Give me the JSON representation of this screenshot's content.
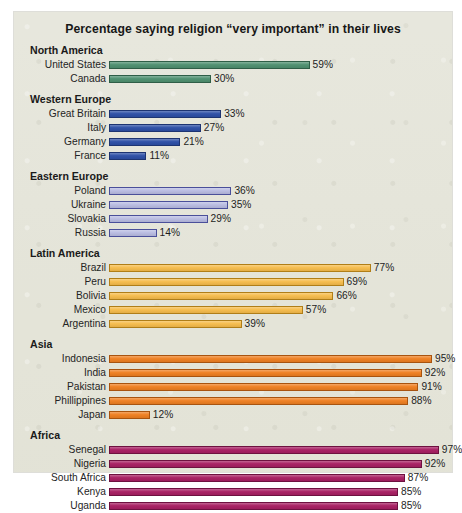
{
  "chart_data": {
    "type": "bar",
    "orientation": "horizontal",
    "title": "Percentage saying religion “very important” in their lives",
    "xlabel": "",
    "ylabel": "",
    "xlim": [
      0,
      100
    ],
    "unit": "%",
    "grid": false,
    "legend": "none",
    "value_label_format": "{value}%",
    "groups": [
      {
        "name": "North America",
        "color": "#4f9070",
        "categories": [
          "United States",
          "Canada"
        ],
        "values": [
          59,
          30
        ],
        "labels": [
          "59%",
          "30%"
        ]
      },
      {
        "name": "Western Europe",
        "color": "#2d4fa6",
        "categories": [
          "Great Britain",
          "Italy",
          "Germany",
          "France"
        ],
        "values": [
          33,
          27,
          21,
          11
        ],
        "labels": [
          "33%",
          "27%",
          "21%",
          "11%"
        ]
      },
      {
        "name": "Eastern Europe",
        "color": "#b9bce2",
        "categories": [
          "Poland",
          "Ukraine",
          "Slovakia",
          "Russia"
        ],
        "values": [
          36,
          35,
          29,
          14
        ],
        "labels": [
          "36%",
          "35%",
          "29%",
          "14%"
        ]
      },
      {
        "name": "Latin America",
        "color": "#f6bc4c",
        "categories": [
          "Brazil",
          "Peru",
          "Bolivia",
          "Mexico",
          "Argentina"
        ],
        "values": [
          77,
          69,
          66,
          57,
          39
        ],
        "labels": [
          "77%",
          "69%",
          "66%",
          "57%",
          "39%"
        ]
      },
      {
        "name": "Asia",
        "color": "#ef8022",
        "categories": [
          "Indonesia",
          "India",
          "Pakistan",
          "Phillippines",
          "Japan"
        ],
        "values": [
          95,
          92,
          91,
          88,
          12
        ],
        "labels": [
          "95%",
          "92%",
          "91%",
          "88%",
          "12%"
        ]
      },
      {
        "name": "Africa",
        "color": "#a81f63",
        "categories": [
          "Senegal",
          "Nigeria",
          "South Africa",
          "Kenya",
          "Uganda"
        ],
        "values": [
          97,
          92,
          87,
          85,
          85
        ],
        "labels": [
          "97%",
          "92%",
          "87%",
          "85%",
          "85%"
        ]
      }
    ]
  },
  "colors": {
    "panel_background": "#e4e4d8",
    "page_background": "#ffffff",
    "title_text": "#171717",
    "label_text": "#242424"
  }
}
